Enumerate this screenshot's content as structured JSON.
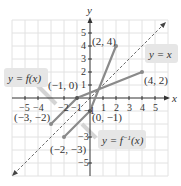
{
  "diagram": {
    "title": "",
    "axes": {
      "x_label": "x",
      "y_label": "y",
      "x_ticks": [
        "−5",
        "−4",
        "−2",
        "−1",
        "1",
        "2",
        "3",
        "4",
        "5"
      ],
      "y_ticks": [
        "5",
        "4",
        "3",
        "2",
        "1",
        "−1",
        "−3",
        "−5"
      ]
    },
    "curves": [
      {
        "name": "f",
        "label": "y = f(x)",
        "points": [
          [
            -3,
            -2
          ],
          [
            -1,
            0
          ],
          [
            4,
            2
          ]
        ]
      },
      {
        "name": "f_inverse",
        "label": "y = f",
        "label_sup": "−1",
        "label_tail": "(x)",
        "points": [
          [
            -2,
            -3
          ],
          [
            0,
            -1
          ],
          [
            2,
            4
          ]
        ]
      },
      {
        "name": "identity",
        "label": "y = x",
        "style": "dashed"
      }
    ],
    "point_labels": {
      "p1": "(2, 4)",
      "p2": "(4, 2)",
      "p3": "(−1, 0)",
      "p4": "(−3, −2)",
      "p5": "(0, −1)",
      "p6": "(−2, −3)"
    },
    "colors": {
      "curve": "#8a8a8a",
      "grid": "#e2e2e2",
      "axis": "#333333",
      "label_box": "#e6e6e6"
    }
  }
}
